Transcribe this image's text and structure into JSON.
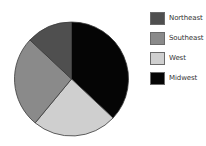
{
  "chart_data": {
    "type": "pie",
    "title": "",
    "categories": [
      "Midwest",
      "West",
      "Southeast",
      "Northeast"
    ],
    "values": [
      37,
      24,
      26,
      13
    ],
    "unit": "percent (estimated from slice angles)",
    "start_angle_deg": 0,
    "direction": "clockwise from 12 o'clock",
    "colors": {
      "Northeast": "#4f4f4f",
      "Southeast": "#8a8a8a",
      "West": "#cfcfcf",
      "Midwest": "#050505"
    },
    "legend": {
      "position": "right",
      "entries": [
        "Northeast",
        "Southeast",
        "West",
        "Midwest"
      ]
    },
    "slice_stroke": "#3a3a3a"
  },
  "legend": {
    "items": [
      {
        "label": "Northeast",
        "color": "#4f4f4f"
      },
      {
        "label": "Southeast",
        "color": "#8a8a8a"
      },
      {
        "label": "West",
        "color": "#cfcfcf"
      },
      {
        "label": "Midwest",
        "color": "#050505"
      }
    ]
  }
}
